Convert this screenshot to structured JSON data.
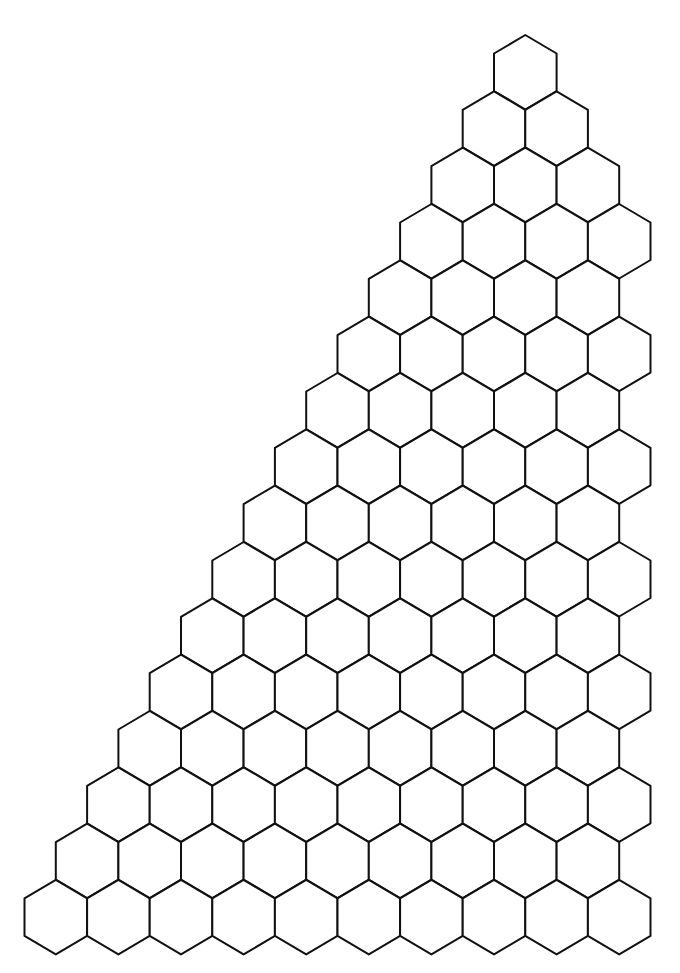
{
  "diagram": {
    "type": "hexagonal-grid",
    "shape": "right-triangle",
    "orientation": "pointy-top",
    "row_count": 16,
    "hexes_per_row": [
      1,
      2,
      3,
      4,
      4,
      5,
      5,
      6,
      6,
      7,
      7,
      8,
      8,
      9,
      9,
      10
    ],
    "total_hexes": 94,
    "colors": {
      "stroke": "#111111",
      "fill": "#ffffff",
      "background": "#ffffff"
    }
  }
}
